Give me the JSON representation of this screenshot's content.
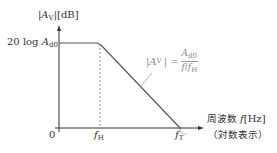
{
  "diagram": {
    "type": "bode-magnitude-plot",
    "y_axis": {
      "label_abs": "|A",
      "label_sub": "V",
      "label_close": "|",
      "label_unit": "[dB]",
      "level_label_prefix": "20 log ",
      "level_label_var": "A",
      "level_label_sub": "d0"
    },
    "x_axis": {
      "origin_label": "0",
      "title_jp": "周波数 ",
      "title_var": "f",
      "title_unit": "[Hz]",
      "subtitle": "（対数表示）",
      "ticks": [
        {
          "var": "f",
          "sub": "H"
        },
        {
          "var": "f",
          "sub": "T"
        }
      ]
    },
    "formula": {
      "lhs_abs": "|A",
      "lhs_sub": "V",
      "lhs_close": "| =",
      "numerator_var": "A",
      "numerator_sub": "d0",
      "denominator_var1": "f",
      "denominator_sep": "/",
      "denominator_var2": "f",
      "denominator_sub": "H"
    },
    "colors": {
      "line": "#555555",
      "axis": "#333333",
      "dashed": "#666666",
      "formula_text": "#8a8a8a"
    }
  }
}
